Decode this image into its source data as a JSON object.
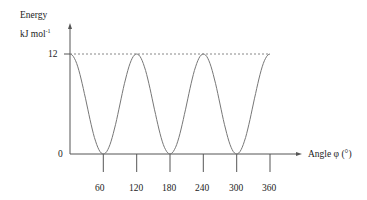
{
  "chart_data": {
    "type": "line",
    "title": "",
    "ylabel": "Energy",
    "yunit": "kJ mol",
    "yunit_sup": "-1",
    "xlabel": "Angle φ (°)",
    "x_ticks": [
      "60",
      "120",
      "180",
      "240",
      "300",
      "360"
    ],
    "y_ticks": [
      "0",
      "12"
    ],
    "xlim": [
      0,
      360
    ],
    "ylim": [
      0,
      12
    ],
    "function": "E = 6(1 + cos(3φ))",
    "x": [
      0,
      60,
      120,
      180,
      240,
      300,
      360
    ],
    "values": [
      12,
      0,
      12,
      0,
      12,
      0,
      12
    ],
    "maxima_line": {
      "y": 12,
      "style": "dashed"
    },
    "grid": false,
    "legend": null
  }
}
